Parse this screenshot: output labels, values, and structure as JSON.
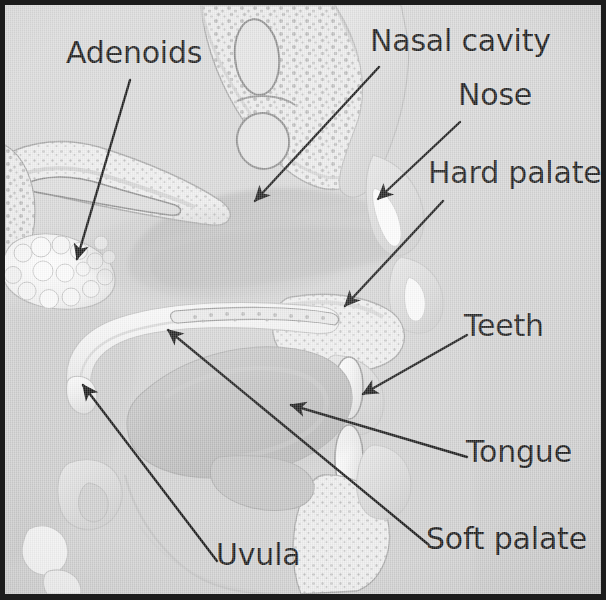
{
  "figure": {
    "kind": "anatomical-cross-section",
    "background_color": "#d9d9d9",
    "border_color": "#1c1c1c",
    "label_color": "#1b1b1b",
    "lead_line_color": "#161616",
    "width": 606,
    "height": 600
  },
  "labels": [
    {
      "id": "adenoids",
      "text": "Adenoids",
      "x": 66,
      "y": 38,
      "anchor": "left"
    },
    {
      "id": "nasal_cavity",
      "text": "Nasal cavity",
      "x": 370,
      "y": 26,
      "anchor": "left"
    },
    {
      "id": "nose",
      "text": "Nose",
      "x": 458,
      "y": 80,
      "anchor": "left"
    },
    {
      "id": "hard_palate",
      "text": "Hard palate",
      "x": 428,
      "y": 158,
      "anchor": "left"
    },
    {
      "id": "teeth",
      "text": "Teeth",
      "x": 464,
      "y": 311,
      "anchor": "left"
    },
    {
      "id": "tongue",
      "text": "Tongue",
      "x": 466,
      "y": 437,
      "anchor": "left"
    },
    {
      "id": "soft_palate",
      "text": "Soft palate",
      "x": 426,
      "y": 524,
      "anchor": "left"
    },
    {
      "id": "uvula",
      "text": "Uvula",
      "x": 216,
      "y": 540,
      "anchor": "left"
    }
  ],
  "leader_lines": [
    {
      "id": "adenoids-leader",
      "from": [
        125,
        75
      ],
      "to": [
        72,
        254
      ],
      "arrow": true
    },
    {
      "id": "nasal-cavity-leader",
      "from": [
        374,
        62
      ],
      "to": [
        250,
        196
      ],
      "arrow": true
    },
    {
      "id": "nose-leader",
      "from": [
        455,
        117
      ],
      "to": [
        373,
        194
      ],
      "arrow": true
    },
    {
      "id": "hard-palate-leader",
      "from": [
        438,
        196
      ],
      "to": [
        340,
        301
      ],
      "arrow": true
    },
    {
      "id": "teeth-leader",
      "from": [
        462,
        330
      ],
      "to": [
        358,
        389
      ],
      "arrow": true
    },
    {
      "id": "tongue-leader",
      "from": [
        462,
        452
      ],
      "to": [
        286,
        400
      ],
      "arrow": true
    },
    {
      "id": "soft-palate-leader",
      "from": [
        424,
        540
      ],
      "to": [
        163,
        325
      ],
      "arrow": true
    },
    {
      "id": "uvula-leader",
      "from": [
        212,
        556
      ],
      "to": [
        78,
        380
      ],
      "arrow": true
    }
  ],
  "structures": [
    {
      "id": "adenoid-mass",
      "name": "Adenoids",
      "description": "nodular lymphoid tissue mass on nasopharynx roof"
    },
    {
      "id": "nasal-cavity",
      "name": "Nasal cavity",
      "description": "open air space behind the nose"
    },
    {
      "id": "nose-tip",
      "name": "Nose",
      "description": "external nasal tip and nostril"
    },
    {
      "id": "hard-palate",
      "name": "Hard palate",
      "description": "bony roof of the mouth"
    },
    {
      "id": "teeth",
      "name": "Teeth",
      "description": "upper and lower incisors"
    },
    {
      "id": "tongue",
      "name": "Tongue",
      "description": "muscular body filling the oral cavity"
    },
    {
      "id": "soft-palate",
      "name": "Soft palate",
      "description": "muscular curtain behind the hard palate"
    },
    {
      "id": "uvula",
      "name": "Uvula",
      "description": "hook-shaped tip of the soft palate"
    },
    {
      "id": "sphenoid-bone",
      "name": "Sphenoid sinus region",
      "description": "speckled cancellous bone with oval cavities"
    },
    {
      "id": "turbinate",
      "name": "Nasal turbinate",
      "description": "scroll-shaped shelf in the nasal cavity"
    },
    {
      "id": "mandible",
      "name": "Mandible",
      "description": "lower jaw bone"
    },
    {
      "id": "epiglottis",
      "name": "Epiglottis",
      "description": "flap above the larynx"
    }
  ]
}
